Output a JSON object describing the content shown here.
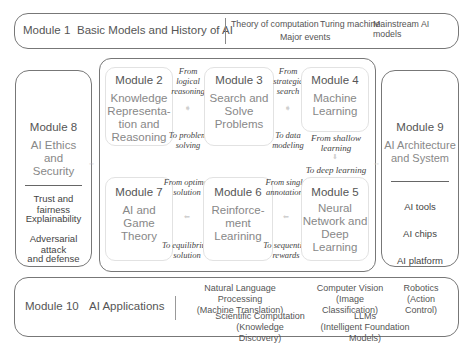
{
  "module1": {
    "label": "Module 1",
    "title": "Basic Models and History of AI",
    "topics": [
      "Theory of computation",
      "Turing machine",
      "Mainstream AI models",
      "Major events"
    ]
  },
  "module8": {
    "label": "Module 8",
    "title_lines": [
      "AI Ethics",
      "and",
      "Security"
    ],
    "items": [
      "Trust and fairness",
      "Explainability",
      "Adversarial attack",
      "and defense"
    ]
  },
  "module9": {
    "label": "Module 9",
    "title_lines": [
      "AI Architecture",
      "and System"
    ],
    "items": [
      "AI tools",
      "AI chips",
      "AI platform"
    ]
  },
  "core": {
    "module2": {
      "label": "Module 2",
      "lines": [
        "Knowledge",
        "Representa-",
        "tion and",
        "Reasoning"
      ]
    },
    "module3": {
      "label": "Module 3",
      "lines": [
        "Search and",
        "Solve",
        "Problems"
      ]
    },
    "module4": {
      "label": "Module 4",
      "lines": [
        "Machine",
        "Learning"
      ]
    },
    "module5": {
      "label": "Module 5",
      "lines": [
        "Neural",
        "Network and",
        "Deep",
        "Learning"
      ]
    },
    "module6": {
      "label": "Module 6",
      "lines": [
        "Reinforce-",
        "ment",
        "Learining"
      ]
    },
    "module7": {
      "label": "Module 7",
      "lines": [
        "AI and",
        "Game",
        "Theory"
      ]
    },
    "transitions": {
      "t23_from": [
        "From logical",
        "reasoning"
      ],
      "t23_to": [
        "To problem",
        "solving"
      ],
      "t34_from": [
        "From strategic",
        "search"
      ],
      "t34_to": [
        "To data",
        "modeling"
      ],
      "t45_from": [
        "From shallow",
        "learning"
      ],
      "t45_to": [
        "To deep learning"
      ],
      "t56_from": [
        "From single",
        "annotations"
      ],
      "t56_to": [
        "To sequential",
        "rewards"
      ],
      "t67_from": [
        "From optimal",
        "solution"
      ],
      "t67_to": [
        "To equilibrium",
        "solution"
      ]
    }
  },
  "module10": {
    "label": "Module 10",
    "title": "AI Applications",
    "apps": [
      {
        "name": "Natural Language Processing",
        "detail": "(Machine Translation)"
      },
      {
        "name": "Computer Vision",
        "detail": "(Image Classification)"
      },
      {
        "name": "Robotics",
        "detail": "(Action Control)"
      },
      {
        "name": "Scientific Computation",
        "detail": "(Knowledge Discovery)"
      },
      {
        "name": "LLMs",
        "detail": "(Intelligent Foundation Models)"
      }
    ]
  },
  "icons": {
    "arrow_right": "➧",
    "arrow_left": "⬅",
    "arrow_down": "⬇",
    "connector": "◦◦"
  }
}
